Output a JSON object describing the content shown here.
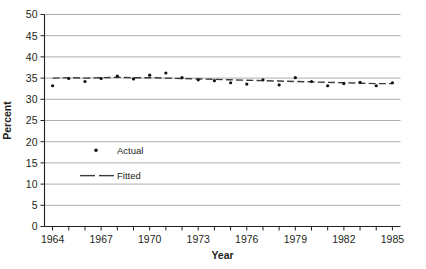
{
  "chart_data": {
    "type": "line",
    "title": "",
    "xlabel": "Year",
    "ylabel": "Percent",
    "xlim": [
      1963.5,
      1985.5
    ],
    "ylim": [
      0,
      50
    ],
    "ytick_values": [
      0,
      5,
      10,
      15,
      20,
      25,
      30,
      35,
      40,
      45,
      50
    ],
    "ytick_labels": [
      "0",
      "5",
      "10",
      "15",
      "20",
      "25",
      "30",
      "35",
      "40",
      "45",
      "50"
    ],
    "xtick_values": [
      1964,
      1965,
      1966,
      1967,
      1968,
      1969,
      1970,
      1971,
      1972,
      1973,
      1974,
      1975,
      1976,
      1977,
      1978,
      1979,
      1980,
      1981,
      1982,
      1983,
      1984,
      1985
    ],
    "xtick_labels_shown": [
      "1964",
      "1967",
      "1970",
      "1973",
      "1976",
      "1979",
      "1982",
      "1985"
    ],
    "xtick_labeled_values": [
      1964,
      1967,
      1970,
      1973,
      1976,
      1979,
      1982,
      1985
    ],
    "grid": "horizontal",
    "legend_position": "inside-left",
    "x": [
      1964,
      1965,
      1966,
      1967,
      1968,
      1969,
      1970,
      1971,
      1972,
      1973,
      1974,
      1975,
      1976,
      1977,
      1978,
      1979,
      1980,
      1981,
      1982,
      1983,
      1984,
      1985
    ],
    "series": [
      {
        "name": "Actual",
        "marker": "dot",
        "color": "#111111",
        "values": [
          33.2,
          34.9,
          34.2,
          34.9,
          35.5,
          34.8,
          35.7,
          36.2,
          35.1,
          34.6,
          34.4,
          33.9,
          33.6,
          34.6,
          33.4,
          35.1,
          34.2,
          33.2,
          33.7,
          34.0,
          33.2,
          33.9
        ]
      },
      {
        "name": "Fitted",
        "marker": "dashed-line",
        "color": "#3b3b3b",
        "values": [
          35.0,
          35.1,
          35.0,
          35.1,
          35.2,
          35.1,
          35.1,
          35.0,
          34.9,
          34.8,
          34.7,
          34.6,
          34.5,
          34.4,
          34.3,
          34.2,
          34.1,
          34.0,
          33.9,
          33.8,
          33.7,
          33.7
        ]
      }
    ],
    "legend": [
      {
        "label": "Actual",
        "marker": "dot"
      },
      {
        "label": "Fitted",
        "marker": "dashed-line"
      }
    ]
  },
  "legend": {
    "actual_label": "Actual",
    "fitted_label": "Fitted"
  },
  "axes": {
    "y_title": "Percent",
    "x_title": "Year"
  },
  "colors": {
    "grid": "#9a9a9a",
    "axis": "#231f20",
    "actual": "#111111",
    "fitted": "#3b3b3b",
    "background": "#ffffff"
  }
}
